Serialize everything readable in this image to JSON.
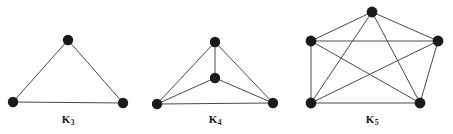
{
  "figure": {
    "background_color": "#ffffff",
    "edge_color": "#4a4a4a",
    "vertex_color": "#1a1a1a",
    "label_color": "#1a1a1a",
    "width": 453,
    "height": 134
  },
  "graphs": [
    {
      "id": "k3",
      "name": "K3",
      "label_text": "K",
      "label_sub": "3",
      "label_x": 68,
      "label_y": 114,
      "vertex_count": 3,
      "edge_count": 3,
      "vertex_radius": 5.2,
      "vertices": [
        {
          "id": "v1",
          "name": "apex",
          "x": 68,
          "y": 40
        },
        {
          "id": "v2",
          "name": "bottom-left",
          "x": 13,
          "y": 102
        },
        {
          "id": "v3",
          "name": "bottom-right",
          "x": 123,
          "y": 103
        }
      ],
      "edges": [
        {
          "from": "v1",
          "to": "v2"
        },
        {
          "from": "v1",
          "to": "v3"
        },
        {
          "from": "v2",
          "to": "v3"
        }
      ]
    },
    {
      "id": "k4",
      "name": "K4",
      "label_text": "K",
      "label_sub": "4",
      "label_x": 215,
      "label_y": 114,
      "vertex_count": 4,
      "edge_count": 6,
      "vertex_radius": 5.2,
      "vertices": [
        {
          "id": "v1",
          "name": "apex",
          "x": 215,
          "y": 42
        },
        {
          "id": "v2",
          "name": "center",
          "x": 215,
          "y": 78
        },
        {
          "id": "v3",
          "name": "bottom-left",
          "x": 157,
          "y": 104
        },
        {
          "id": "v4",
          "name": "bottom-right",
          "x": 273,
          "y": 103
        }
      ],
      "edges": [
        {
          "from": "v1",
          "to": "v2"
        },
        {
          "from": "v1",
          "to": "v3"
        },
        {
          "from": "v1",
          "to": "v4"
        },
        {
          "from": "v2",
          "to": "v3"
        },
        {
          "from": "v2",
          "to": "v4"
        },
        {
          "from": "v3",
          "to": "v4"
        }
      ]
    },
    {
      "id": "k5",
      "name": "K5",
      "label_text": "K",
      "label_sub": "5",
      "label_x": 372,
      "label_y": 114,
      "vertex_count": 5,
      "edge_count": 10,
      "vertex_radius": 5.4,
      "vertices": [
        {
          "id": "v1",
          "name": "top",
          "x": 372,
          "y": 12
        },
        {
          "id": "v2",
          "name": "left",
          "x": 311,
          "y": 41
        },
        {
          "id": "v3",
          "name": "right",
          "x": 438,
          "y": 41
        },
        {
          "id": "v4",
          "name": "bottom-left",
          "x": 311,
          "y": 103
        },
        {
          "id": "v5",
          "name": "bottom-right",
          "x": 420,
          "y": 103
        }
      ],
      "edges": [
        {
          "from": "v1",
          "to": "v2"
        },
        {
          "from": "v1",
          "to": "v3"
        },
        {
          "from": "v1",
          "to": "v4"
        },
        {
          "from": "v1",
          "to": "v5"
        },
        {
          "from": "v2",
          "to": "v3"
        },
        {
          "from": "v2",
          "to": "v4"
        },
        {
          "from": "v2",
          "to": "v5"
        },
        {
          "from": "v3",
          "to": "v4"
        },
        {
          "from": "v3",
          "to": "v5"
        },
        {
          "from": "v4",
          "to": "v5"
        }
      ]
    }
  ]
}
